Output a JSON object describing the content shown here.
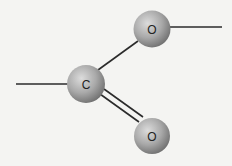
{
  "diagram": {
    "type": "molecular-structure",
    "atoms": [
      {
        "id": "c1",
        "symbol": "C",
        "cx": 86,
        "cy": 84,
        "r": 19
      },
      {
        "id": "o1",
        "symbol": "O",
        "cx": 152,
        "cy": 29,
        "r": 18.5
      },
      {
        "id": "o2",
        "symbol": "O",
        "cx": 152,
        "cy": 136,
        "r": 18
      }
    ],
    "bonds": [
      {
        "from": "left-stub",
        "to": "c1",
        "order": 1
      },
      {
        "from": "c1",
        "to": "o1",
        "order": 1
      },
      {
        "from": "c1",
        "to": "o2",
        "order": 2
      },
      {
        "from": "o1",
        "to": "right-stub",
        "order": 1
      }
    ],
    "colors": {
      "atom_light": "#d9d9d9",
      "atom_mid": "#a8a8a8",
      "atom_dark": "#6e6e6e",
      "bond": "#2b2b2b",
      "background": "#f4f4f2"
    }
  }
}
